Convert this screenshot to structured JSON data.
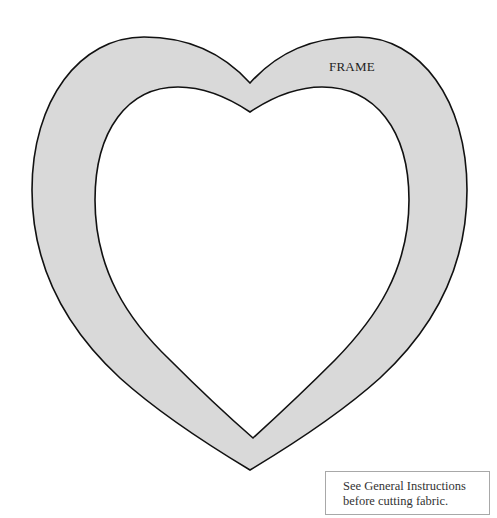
{
  "pattern": {
    "piece_label": "FRAME",
    "fill_color": "#d9d9d9",
    "outline_color": "#111111",
    "shape": "heart-frame"
  },
  "note": {
    "line1": "See General Instructions",
    "line2": "before cutting fabric."
  }
}
